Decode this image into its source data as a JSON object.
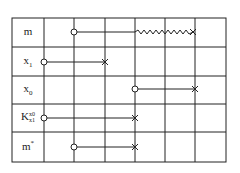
{
  "diagram": {
    "rows": [
      {
        "label": "m",
        "sub": "",
        "sup": "",
        "start_col": 1,
        "end_col": 5,
        "line": "solid-then-zigzag",
        "zigzag_from_col": 3
      },
      {
        "label": "x",
        "sub": "1",
        "sup": "",
        "start_col": 0,
        "end_col": 2,
        "line": "solid"
      },
      {
        "label": "x",
        "sub": "0",
        "sup": "",
        "start_col": 3,
        "end_col": 5,
        "line": "solid"
      },
      {
        "label": "K",
        "sub": "x1",
        "sup": "x0",
        "start_col": 0,
        "end_col": 3,
        "line": "solid"
      },
      {
        "label": "m",
        "sub": "",
        "sup": "*",
        "start_col": 1,
        "end_col": 3,
        "line": "solid"
      }
    ],
    "start_marker": "circle",
    "end_marker": "cross",
    "columns": 6
  },
  "labels": {
    "r0": "m",
    "r1_base": "x",
    "r1_sub": "1",
    "r2_base": "x",
    "r2_sub": "0",
    "r3_base": "K",
    "r3_sup": "x0",
    "r3_sub": "x1",
    "r4_base": "m",
    "r4_sup": "*"
  }
}
